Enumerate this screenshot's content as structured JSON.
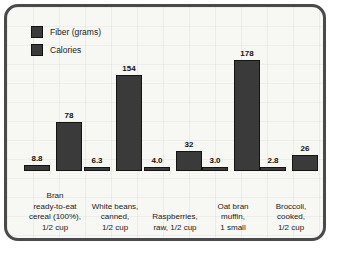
{
  "chart_data": {
    "type": "bar",
    "title": "",
    "xlabel": "",
    "ylabel": "",
    "grid": true,
    "legend_position": "top-left",
    "categories": [
      "Bran\nready-to-eat\ncereal (100%),\n1/2 cup",
      "White beans,\ncanned,\n1/2 cup",
      "Raspberries,\nraw, 1/2 cup",
      "Oat bran\nmuffin,\n1 small",
      "Broccoli,\ncooked,\n1/2 cup"
    ],
    "series": [
      {
        "name": "Fiber (grams)",
        "values": [
          8.8,
          6.3,
          4.0,
          3.0,
          2.8
        ],
        "labels": [
          "8.8",
          "6.3",
          "4.0",
          "3.0",
          "2.8"
        ],
        "color": "#3a3a3a"
      },
      {
        "name": "Calories",
        "values": [
          78,
          154,
          32,
          178,
          26
        ],
        "labels": [
          "78",
          "154",
          "32",
          "178",
          "26"
        ],
        "color": "#3a3a3a"
      }
    ],
    "ylim": [
      0,
      190
    ]
  },
  "legend": {
    "items": [
      {
        "label": "Fiber (grams)",
        "color": "#3a3a3a"
      },
      {
        "label": "Calories",
        "color": "#3a3a3a"
      }
    ]
  }
}
